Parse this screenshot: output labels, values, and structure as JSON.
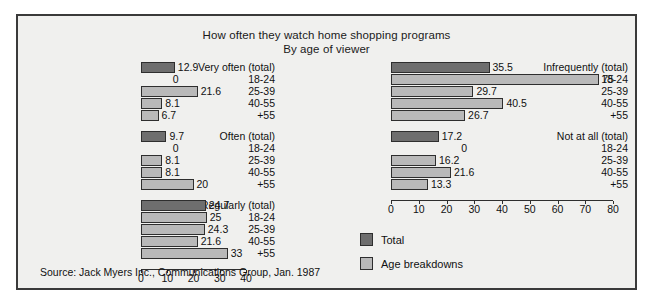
{
  "chart_data": {
    "type": "bar",
    "title": "How often they watch home shopping programs",
    "subtitle": "By age of viewer",
    "orientation": "horizontal",
    "xlabel": "",
    "ylabel": "",
    "grid": false,
    "legend_position": "bottom-center",
    "legend": [
      {
        "name": "Total",
        "color": "#6e6e6e"
      },
      {
        "name": "Age breakdowns",
        "color": "#b9b9b9"
      }
    ],
    "categories": [
      "(total)",
      "18-24",
      "25-39",
      "40-55",
      "+55"
    ],
    "source": "Source: Jack Myers Inc., Communications Group, Jan. 1987",
    "panels": [
      {
        "id": "left",
        "xlim": [
          0,
          40
        ],
        "ticks": [
          0,
          10,
          20,
          30,
          40
        ],
        "groups": [
          {
            "name": "Very often",
            "rows": [
              {
                "label": "Very often  (total)",
                "value": 12.9,
                "series": "Total"
              },
              {
                "label": "18-24",
                "value": 0,
                "series": "Age breakdowns"
              },
              {
                "label": "25-39",
                "value": 21.6,
                "series": "Age breakdowns"
              },
              {
                "label": "40-55",
                "value": 8.1,
                "series": "Age breakdowns"
              },
              {
                "label": "+55",
                "value": 6.7,
                "series": "Age breakdowns"
              }
            ]
          },
          {
            "name": "Often",
            "rows": [
              {
                "label": "Often  (total)",
                "value": 9.7,
                "series": "Total"
              },
              {
                "label": "18-24",
                "value": 0,
                "series": "Age breakdowns"
              },
              {
                "label": "25-39",
                "value": 8.1,
                "series": "Age breakdowns"
              },
              {
                "label": "40-55",
                "value": 8.1,
                "series": "Age breakdowns"
              },
              {
                "label": "+55",
                "value": 20,
                "series": "Age breakdowns"
              }
            ]
          },
          {
            "name": "Regularly",
            "rows": [
              {
                "label": "Regularly  (total)",
                "value": 24.7,
                "series": "Total"
              },
              {
                "label": "18-24",
                "value": 25,
                "series": "Age breakdowns"
              },
              {
                "label": "25-39",
                "value": 24.3,
                "series": "Age breakdowns"
              },
              {
                "label": "40-55",
                "value": 21.6,
                "series": "Age breakdowns"
              },
              {
                "label": "+55",
                "value": 33,
                "series": "Age breakdowns"
              }
            ]
          }
        ]
      },
      {
        "id": "right",
        "xlim": [
          0,
          80
        ],
        "ticks": [
          0,
          10,
          20,
          30,
          40,
          50,
          60,
          70,
          80
        ],
        "groups": [
          {
            "name": "Infrequently",
            "rows": [
              {
                "label": "Infrequently  (total)",
                "value": 35.5,
                "series": "Total"
              },
              {
                "label": "18-24",
                "value": 75,
                "series": "Age breakdowns"
              },
              {
                "label": "25-39",
                "value": 29.7,
                "series": "Age breakdowns"
              },
              {
                "label": "40-55",
                "value": 40.5,
                "series": "Age breakdowns"
              },
              {
                "label": "+55",
                "value": 26.7,
                "series": "Age breakdowns"
              }
            ]
          },
          {
            "name": "Not at all",
            "rows": [
              {
                "label": "Not at all  (total)",
                "value": 17.2,
                "series": "Total"
              },
              {
                "label": "18-24",
                "value": 0,
                "series": "Age breakdowns"
              },
              {
                "label": "25-39",
                "value": 16.2,
                "series": "Age breakdowns"
              },
              {
                "label": "40-55",
                "value": 21.6,
                "series": "Age breakdowns"
              },
              {
                "label": "+55",
                "value": 13.3,
                "series": "Age breakdowns"
              }
            ]
          }
        ]
      }
    ]
  }
}
